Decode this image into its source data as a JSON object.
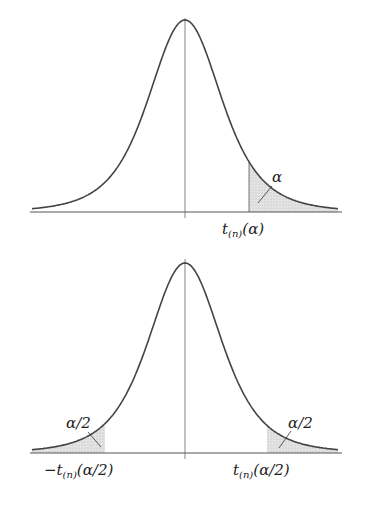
{
  "chart_data": [
    {
      "type": "line",
      "title": "Student t distribution - one-sided critical value",
      "xlabel": "",
      "ylabel": "",
      "shaded_region": "right tail",
      "annotations": [
        {
          "text": "α",
          "role": "tail-area-label"
        },
        {
          "text": "t(n)(α)",
          "role": "critical-value-label"
        }
      ]
    },
    {
      "type": "line",
      "title": "Student t distribution - two-sided critical values",
      "xlabel": "",
      "ylabel": "",
      "shaded_region": "both tails",
      "annotations": [
        {
          "text": "α/2",
          "role": "left-tail-area-label"
        },
        {
          "text": "α/2",
          "role": "right-tail-area-label"
        },
        {
          "text": "−t(n)(α/2)",
          "role": "left-critical-value-label"
        },
        {
          "text": "t(n)(α/2)",
          "role": "right-critical-value-label"
        }
      ]
    }
  ],
  "top": {
    "tail_label": "α",
    "crit": {
      "t": "t",
      "sub": "(n)",
      "arg": "(α)"
    }
  },
  "bottom": {
    "left_tail_label": "α/2",
    "right_tail_label": "α/2",
    "left_crit": {
      "neg": "−",
      "t": "t",
      "sub": "(n)",
      "arg": "(α/2)"
    },
    "right_crit": {
      "t": "t",
      "sub": "(n)",
      "arg": "(α/2)"
    }
  },
  "colors": {
    "curve": "#444444",
    "axis": "#555555",
    "shade": "#d8d8d8"
  }
}
